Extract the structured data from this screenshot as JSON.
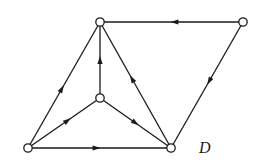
{
  "diagram": {
    "type": "directed-graph",
    "label": "D",
    "label_position": {
      "x": 199,
      "y": 140
    },
    "colors": {
      "stroke": "#1a1a1a",
      "node_fill": "#ffffff",
      "background": "#ffffff"
    },
    "nodes": [
      {
        "id": "top-center",
        "x": 100,
        "y": 22
      },
      {
        "id": "top-right",
        "x": 243,
        "y": 22
      },
      {
        "id": "middle",
        "x": 100,
        "y": 98
      },
      {
        "id": "bottom-left",
        "x": 28,
        "y": 148
      },
      {
        "id": "bottom-right",
        "x": 171,
        "y": 148
      }
    ],
    "edges": [
      {
        "from": "top-right",
        "to": "top-center",
        "arrow_at": 0.48
      },
      {
        "from": "top-right",
        "to": "bottom-right",
        "arrow_at": 0.47
      },
      {
        "from": "bottom-left",
        "to": "top-center",
        "arrow_at": 0.47
      },
      {
        "from": "middle",
        "to": "top-center",
        "arrow_at": 0.5
      },
      {
        "from": "bottom-right",
        "to": "top-center",
        "arrow_at": 0.55
      },
      {
        "from": "bottom-left",
        "to": "middle",
        "arrow_at": 0.55
      },
      {
        "from": "middle",
        "to": "bottom-right",
        "arrow_at": 0.5
      },
      {
        "from": "bottom-left",
        "to": "bottom-right",
        "arrow_at": 0.48
      }
    ]
  }
}
